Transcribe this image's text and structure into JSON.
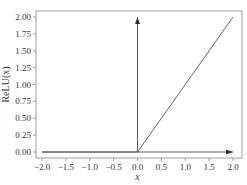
{
  "chart_data": {
    "type": "line",
    "title": "",
    "xlabel": "x",
    "ylabel": "ReLU(x)",
    "xlim": [
      -2.0,
      2.0
    ],
    "ylim": [
      0.0,
      2.0
    ],
    "grid": false,
    "legend": "none",
    "x_ticks": [
      -2.0,
      -1.5,
      -1.0,
      -0.5,
      0.0,
      0.5,
      1.0,
      1.5,
      2.0
    ],
    "x_tick_labels": [
      "−2.0",
      "−1.5",
      "−1.0",
      "−0.5",
      "0.0",
      "0.5",
      "1.0",
      "1.5",
      "2.0"
    ],
    "y_ticks": [
      0.0,
      0.25,
      0.5,
      0.75,
      1.0,
      1.25,
      1.5,
      1.75,
      2.0
    ],
    "y_tick_labels": [
      "0.00",
      "0.25",
      "0.50",
      "0.75",
      "1.00",
      "1.25",
      "1.50",
      "1.75",
      "2.00"
    ],
    "series": [
      {
        "name": "ReLU(x)",
        "x": [
          -2.0,
          0.0,
          2.0
        ],
        "y": [
          0.0,
          0.0,
          2.0
        ],
        "color": "#555555"
      }
    ],
    "annotations": [
      {
        "type": "arrow",
        "name": "x-axis-arrow",
        "from": [
          -2.0,
          0.0
        ],
        "to": [
          2.0,
          0.0
        ]
      },
      {
        "type": "arrow",
        "name": "y-axis-arrow",
        "from": [
          0.0,
          0.0
        ],
        "to": [
          0.0,
          2.0
        ]
      }
    ],
    "colors": {
      "frame": "#888888",
      "line": "#555555",
      "axes_arrows": "#333333",
      "text": "#333333"
    }
  }
}
